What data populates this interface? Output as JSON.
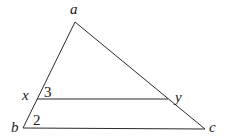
{
  "diagram": {
    "type": "triangle-with-parallel-segment",
    "points": {
      "a": {
        "label": "a",
        "x": 75,
        "y": 22
      },
      "b": {
        "label": "b",
        "x": 23,
        "y": 128
      },
      "c": {
        "label": "c",
        "x": 205,
        "y": 129
      },
      "x": {
        "label": "x",
        "x": 37,
        "y": 99
      },
      "y": {
        "label": "y",
        "x": 168,
        "y": 99
      }
    },
    "segments": [
      {
        "name": "ab",
        "from": "a",
        "to": "b"
      },
      {
        "name": "ac",
        "from": "a",
        "to": "c"
      },
      {
        "name": "bc",
        "from": "b",
        "to": "c"
      },
      {
        "name": "xy",
        "from": "x",
        "to": "y"
      }
    ],
    "angle_labels": {
      "angle3": "3",
      "angle2": "2"
    },
    "line_color": "#2a2a2a"
  }
}
